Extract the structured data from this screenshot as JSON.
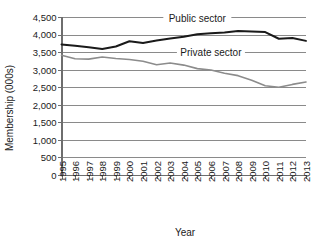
{
  "chart_data": {
    "type": "line",
    "title": "",
    "xlabel": "Year",
    "ylabel": "Membership (000s)",
    "ylim": [
      0,
      4500
    ],
    "ytick_step": 500,
    "grid": true,
    "legend_position": "inline-annotation",
    "ytick_labels": [
      "4,500",
      "4,000",
      "3,500",
      "3,000",
      "2,500",
      "2,000",
      "1,500",
      "1,000",
      "500",
      "0"
    ],
    "ytick_values": [
      4500,
      4000,
      3500,
      3000,
      2500,
      2000,
      1500,
      1000,
      500,
      0
    ],
    "categories": [
      "1995",
      "1996",
      "1997",
      "1998",
      "1999",
      "2000",
      "2001",
      "2002",
      "2003",
      "2004",
      "2005",
      "2006",
      "2007",
      "2008",
      "2009",
      "2010",
      "2011",
      "2012",
      "2013"
    ],
    "x": [
      1995,
      1996,
      1997,
      1998,
      1999,
      2000,
      2001,
      2002,
      2003,
      2004,
      2005,
      2006,
      2007,
      2008,
      2009,
      2010,
      2011,
      2012,
      2013
    ],
    "series": [
      {
        "name": "Public sector",
        "color": "#1a1a1a",
        "width": 2.0,
        "label_x": 2005,
        "label_y": 4350,
        "values": [
          3720,
          3680,
          3640,
          3590,
          3660,
          3810,
          3760,
          3830,
          3890,
          3940,
          4010,
          4040,
          4060,
          4100,
          4090,
          4070,
          3880,
          3900,
          3820
        ]
      },
      {
        "name": "Private sector",
        "color": "#8c8c8c",
        "width": 1.6,
        "label_x": 2006,
        "label_y": 3400,
        "values": [
          3410,
          3310,
          3300,
          3360,
          3320,
          3290,
          3240,
          3140,
          3190,
          3130,
          3030,
          2990,
          2900,
          2830,
          2700,
          2540,
          2500,
          2580,
          2650
        ]
      }
    ]
  }
}
